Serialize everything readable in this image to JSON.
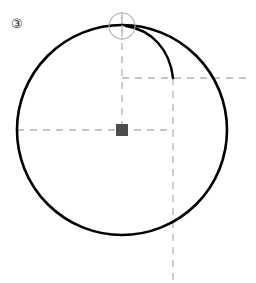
{
  "figure": {
    "label": "③",
    "label_text": "3",
    "label_position": {
      "x": 11,
      "y": 17
    },
    "canvas": {
      "width": 256,
      "height": 283,
      "background": "#ffffff"
    },
    "colors": {
      "stroke": "#000000",
      "dashed_guide": "#b3b3b3",
      "marker_fill": "#4d4d4d",
      "small_circle_stroke": "#b0b0b0",
      "label_color": "#1a1a1a"
    },
    "elements": {
      "main_circle": {
        "name": "large-circle",
        "cx": 122,
        "cy": 130,
        "r": 105,
        "stroke_width": 2.6,
        "fill": "none"
      },
      "rolling_point_circle": {
        "name": "small-circle-at-top",
        "cx": 122,
        "cy": 26,
        "r": 13,
        "stroke_width": 1.1,
        "fill": "none"
      },
      "secondary_arc": {
        "name": "curve-arc",
        "path": "M 126 26 C 152 30 170 50 173 78",
        "stroke_width": 2.4,
        "fill": "none"
      },
      "center_marker": {
        "name": "center-square-marker",
        "x": 116,
        "y": 124,
        "width": 12,
        "height": 12
      }
    },
    "guides": [
      {
        "name": "horizontal-guide-center",
        "orientation": "horizontal",
        "x1": 17,
        "y1": 130,
        "x2": 174,
        "y2": 130
      },
      {
        "name": "vertical-guide-center",
        "orientation": "vertical",
        "x1": 122,
        "y1": 17,
        "x2": 122,
        "y2": 130
      },
      {
        "name": "horizontal-guide-upper",
        "orientation": "horizontal",
        "x1": 122,
        "y1": 78,
        "x2": 246,
        "y2": 78
      },
      {
        "name": "vertical-guide-right",
        "orientation": "vertical",
        "x1": 173,
        "y1": 78,
        "x2": 173,
        "y2": 281
      }
    ],
    "dash_pattern": "7 6",
    "guide_stroke_width": 1.3
  }
}
